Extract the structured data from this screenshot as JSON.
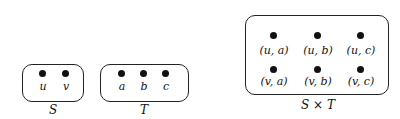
{
  "sets": {
    "S": {
      "caption": "S",
      "elements": [
        "u",
        "v"
      ]
    },
    "T": {
      "caption": "T",
      "elements": [
        "a",
        "b",
        "c"
      ]
    },
    "SxT": {
      "caption": "S × T",
      "row1": [
        "(u, a)",
        "(u, b)",
        "(u, c)"
      ],
      "row2": [
        "(v, a)",
        "(v, b)",
        "(v, c)"
      ]
    }
  }
}
